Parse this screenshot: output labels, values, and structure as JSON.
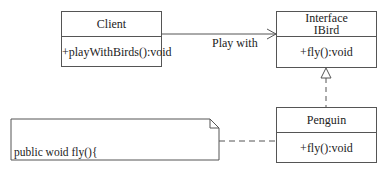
{
  "diagram": {
    "type": "uml-class",
    "classes": {
      "client": {
        "name": "Client",
        "methods": "+playWithBirds():void"
      },
      "ibird": {
        "stereotype": "Interface",
        "name": "IBird",
        "methods": "+fly():void"
      },
      "penguin": {
        "name": "Penguin",
        "methods": "+fly():void"
      }
    },
    "relations": {
      "association": {
        "from": "Client",
        "to": "IBird",
        "label": "Play with"
      },
      "realization": {
        "from": "Penguin",
        "to": "IBird"
      },
      "note_link": {
        "from": "note",
        "to": "Penguin"
      }
    },
    "note": {
      "line1": "public woid fly(){",
      "line2": "System.out.println(\"Error!Penguins don't fly\"!);",
      "line3": "}"
    },
    "colors": {
      "stroke": "#555555",
      "text": "#222222",
      "background": "#ffffff"
    }
  }
}
